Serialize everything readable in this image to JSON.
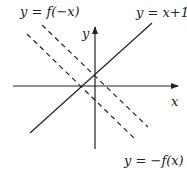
{
  "diagram": {
    "axes": {
      "x_label": "x",
      "y_label": "y"
    },
    "curves": [
      {
        "id": "y_eq_x_plus_1",
        "label": "y = x+1",
        "style": "solid"
      },
      {
        "id": "y_eq_f_neg_x",
        "label": "y = f(−x)",
        "style": "dashed"
      },
      {
        "id": "y_eq_neg_f_x",
        "label": "y = −f(x)",
        "style": "dashed"
      }
    ],
    "colors": {
      "line": "#222222",
      "background": "#ffffff"
    }
  }
}
